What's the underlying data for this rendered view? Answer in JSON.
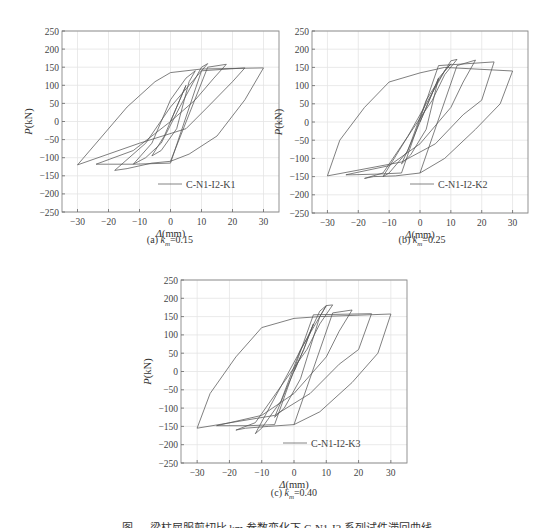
{
  "figure": {
    "caption": "图 — 梁柱屈服剪切比 km 参数变化下 C-N1-I2 系列试件滞回曲线"
  },
  "chart_data": [
    {
      "id": "a",
      "type": "line",
      "title": "",
      "caption_prefix": "(a) ",
      "caption_var": "k",
      "caption_sub": "m",
      "caption_value": "=0.15",
      "xlabel": "Δ(mm)",
      "ylabel": "P(kN)",
      "xlim": [
        -35,
        35
      ],
      "ylim": [
        -250,
        250
      ],
      "xticks": [
        -30,
        -20,
        -10,
        0,
        10,
        20,
        30
      ],
      "yticks": [
        250,
        200,
        150,
        100,
        50,
        0,
        -50,
        -100,
        -150,
        -200,
        -250
      ],
      "grid": true,
      "legend": {
        "position": "lower right",
        "entries": [
          "C-N1-I2-K1"
        ]
      },
      "series": [
        {
          "name": "C-N1-I2-K1",
          "x": [
            0,
            3,
            5,
            2,
            -2,
            -6,
            -3,
            2,
            6,
            8,
            5,
            0,
            -6,
            -12,
            -8,
            -3,
            3,
            10,
            12,
            10,
            6,
            0,
            -8,
            -18,
            -14,
            -6,
            0,
            12,
            18,
            14,
            8,
            0,
            -12,
            -24,
            -20,
            -12,
            0,
            10,
            24,
            20,
            12,
            5,
            -10,
            -30,
            -22,
            -14,
            -5,
            0,
            10,
            30,
            24,
            15,
            6,
            0
          ],
          "y": [
            0,
            60,
            100,
            40,
            -40,
            -95,
            -80,
            -20,
            110,
            140,
            120,
            60,
            -60,
            -118,
            -100,
            -60,
            40,
            150,
            160,
            140,
            100,
            40,
            -60,
            -135,
            -130,
            -115,
            -110,
            150,
            158,
            120,
            60,
            0,
            -80,
            -118,
            -118,
            -118,
            -115,
            140,
            148,
            110,
            40,
            -20,
            -60,
            -120,
            -40,
            40,
            110,
            135,
            145,
            148,
            60,
            -40,
            -90,
            -110
          ]
        }
      ]
    },
    {
      "id": "b",
      "type": "line",
      "title": "",
      "caption_prefix": "(b) ",
      "caption_var": "k",
      "caption_sub": "m",
      "caption_value": "=0.25",
      "xlabel": "Δ(mm)",
      "ylabel": "P(kN)",
      "xlim": [
        -35,
        35
      ],
      "ylim": [
        -250,
        250
      ],
      "xticks": [
        -30,
        -20,
        -10,
        0,
        10,
        20,
        30
      ],
      "yticks": [
        250,
        200,
        150,
        100,
        50,
        0,
        -50,
        -100,
        -150,
        -200,
        -250
      ],
      "grid": true,
      "legend": {
        "position": "lower right",
        "entries": [
          "C-N1-I2-K2"
        ]
      },
      "series": [
        {
          "name": "C-N1-I2-K2",
          "x": [
            0,
            3,
            6,
            3,
            -2,
            -6,
            -3,
            2,
            6,
            10,
            8,
            4,
            -4,
            -12,
            -10,
            -4,
            2,
            10,
            12,
            8,
            4,
            -4,
            -12,
            -18,
            -15,
            -8,
            0,
            12,
            18,
            14,
            10,
            0,
            -10,
            -24,
            -22,
            -14,
            -6,
            6,
            24,
            20,
            14,
            5,
            -6,
            -30,
            -26,
            -18,
            -10,
            0,
            8,
            30,
            26,
            18,
            8,
            0
          ],
          "y": [
            0,
            60,
            120,
            60,
            -40,
            -115,
            -90,
            -20,
            120,
            160,
            140,
            80,
            -40,
            -150,
            -140,
            -80,
            60,
            168,
            172,
            130,
            60,
            -40,
            -140,
            -155,
            -150,
            -148,
            -140,
            155,
            170,
            110,
            40,
            -60,
            -120,
            -145,
            -145,
            -143,
            -140,
            155,
            165,
            60,
            20,
            -60,
            -110,
            -148,
            -50,
            40,
            110,
            135,
            150,
            140,
            50,
            -20,
            -100,
            -140
          ]
        }
      ]
    },
    {
      "id": "c",
      "type": "line",
      "title": "",
      "caption_prefix": "(c) ",
      "caption_var": "k",
      "caption_sub": "m",
      "caption_value": "=0.40",
      "xlabel": "Δ(mm)",
      "ylabel": "P(kN)",
      "xlim": [
        -35,
        35
      ],
      "ylim": [
        -250,
        250
      ],
      "xticks": [
        -30,
        -20,
        -10,
        0,
        10,
        20,
        30
      ],
      "yticks": [
        250,
        200,
        150,
        100,
        50,
        0,
        -50,
        -100,
        -150,
        -200,
        -250
      ],
      "grid": true,
      "legend": {
        "position": "lower right",
        "entries": [
          "C-N1-I2-K3"
        ]
      },
      "series": [
        {
          "name": "C-N1-I2-K3",
          "x": [
            0,
            3,
            6,
            3,
            -2,
            -6,
            -3,
            2,
            8,
            10,
            8,
            4,
            -4,
            -12,
            -10,
            -4,
            2,
            10,
            12,
            8,
            4,
            -4,
            -12,
            -18,
            -15,
            -8,
            0,
            12,
            18,
            14,
            10,
            0,
            -10,
            -24,
            -22,
            -14,
            -6,
            6,
            24,
            20,
            14,
            5,
            -6,
            -30,
            -26,
            -18,
            -10,
            0,
            8,
            30,
            26,
            18,
            8,
            0
          ],
          "y": [
            0,
            60,
            130,
            60,
            -40,
            -125,
            -100,
            -20,
            150,
            180,
            165,
            90,
            -40,
            -170,
            -155,
            -80,
            60,
            180,
            182,
            130,
            60,
            -40,
            -140,
            -160,
            -155,
            -150,
            -145,
            160,
            168,
            110,
            40,
            -60,
            -120,
            -148,
            -148,
            -148,
            -145,
            155,
            158,
            60,
            20,
            -60,
            -120,
            -155,
            -60,
            40,
            120,
            145,
            150,
            157,
            50,
            -30,
            -110,
            -145
          ]
        }
      ]
    }
  ]
}
